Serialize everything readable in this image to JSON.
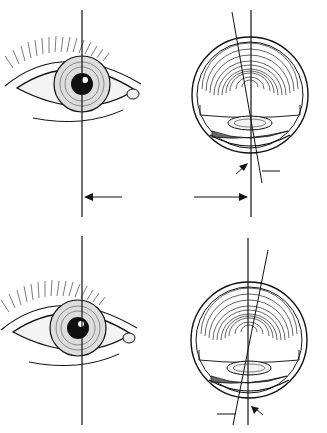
{
  "figure": {
    "panels": [
      {
        "row": 1,
        "type": "front-view-eye",
        "arrow": "left"
      },
      {
        "row": 1,
        "type": "cross-section-eye",
        "arrow": "right",
        "pointer": "corneal-reflex"
      },
      {
        "row": 2,
        "type": "front-view-eye"
      },
      {
        "row": 2,
        "type": "cross-section-eye",
        "pointer": "corneal-reflex"
      }
    ],
    "colors": {
      "ink": "#111111",
      "background": "#ffffff"
    }
  }
}
